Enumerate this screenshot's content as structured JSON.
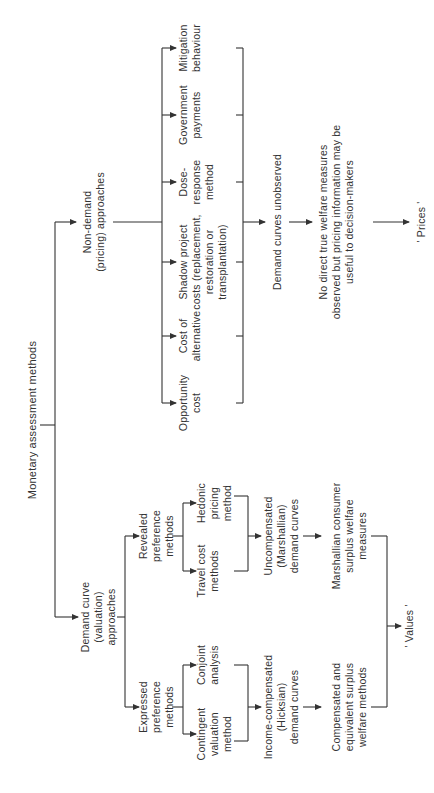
{
  "diagram": {
    "title": "Monetary assessment methods",
    "line_color": "#333333",
    "text_color": "#333333",
    "nodes": {
      "root": "Monetary assessment methods",
      "non_demand": "Non-demand\n(pricing)  approaches",
      "demand_curve": "Demand curve\n(valuation)\napproaches",
      "mitigation": "Mitigation\nbehaviour",
      "government": "Government\npayments",
      "dose_response": "Dose-\nresponse\nmethod",
      "shadow_project": "Shadow project\ncosts (replacement,\nrestoration or\ntransplantation)",
      "cost_alternative": "Cost of\nalternative",
      "opportunity_cost": "Opportunity\ncost",
      "demand_unobserved": "Demand curves unobserved",
      "no_direct": "No direct true welfare measures\nobserved but pricing information may be\nuseful to decision-makers",
      "prices": "' Prices '",
      "revealed": "Revealed\npreference\nmethods",
      "expressed": "Expressed\npreference\nmethods",
      "hedonic": "Hedonic\npricing\nmethod",
      "travel_cost": "Travel cost\nmethods",
      "conjoint": "Conjoint\nanalysis",
      "contingent": "Contingent\nvaluation\nmethod",
      "uncompensated": "Uncompensated\n(Marshallian)\ndemand curves",
      "income_compensated": "Income-compensated\n(Hicksian)\ndemand curves",
      "marshallian_surplus": "Marshallian consumer\nsurplus welfare\nmeasures",
      "compensated_surplus": "Compensated and\nequivalent surplus\nwelfare methods",
      "values": "' Values '"
    }
  }
}
